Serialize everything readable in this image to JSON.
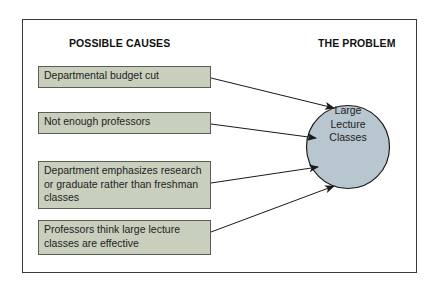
{
  "diagram": {
    "left_heading": "POSSIBLE CAUSES",
    "right_heading": "THE PROBLEM",
    "causes": [
      {
        "label": "Departmental budget cut"
      },
      {
        "label": "Not enough professors"
      },
      {
        "label": "Department emphasizes research or graduate rather than freshman classes"
      },
      {
        "label": "Professors think large lecture classes are effective"
      }
    ],
    "problem": {
      "label": "Large Lecture Classes",
      "lines": [
        "Large",
        "Lecture",
        "Classes"
      ]
    },
    "colors": {
      "cause_fill": "#c9cfbd",
      "problem_fill": "#b8c6cf",
      "stroke": "#1a1a1a"
    }
  }
}
